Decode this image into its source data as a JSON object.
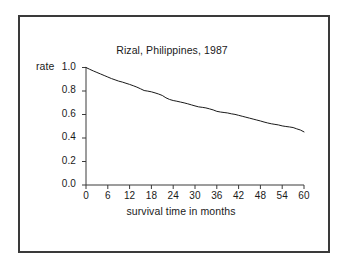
{
  "chart_data": {
    "type": "line",
    "title": "Rizal, Philippines, 1987",
    "xlabel": "survival time in months",
    "ylabel": "rate",
    "xlim": [
      0,
      60
    ],
    "ylim": [
      0.0,
      1.0
    ],
    "grid": false,
    "legend": null,
    "xticks": [
      "0",
      "6",
      "12",
      "18",
      "24",
      "30",
      "36",
      "42",
      "48",
      "54",
      "60"
    ],
    "yticks": [
      "1.0",
      "0.8",
      "0.6",
      "0.4",
      "0.2",
      "0.0"
    ],
    "line_color": "#1a1a1a",
    "series": [
      {
        "name": "survival rate",
        "x": [
          0,
          1,
          2,
          3,
          4,
          5,
          6,
          7,
          8,
          9,
          10,
          11,
          12,
          13,
          14,
          15,
          16,
          17,
          18,
          19,
          20,
          21,
          22,
          23,
          24,
          25,
          26,
          27,
          28,
          29,
          30,
          31,
          32,
          33,
          34,
          35,
          36,
          37,
          38,
          39,
          40,
          41,
          42,
          43,
          44,
          45,
          46,
          47,
          48,
          49,
          50,
          51,
          52,
          53,
          54,
          55,
          56,
          57,
          58,
          59,
          60
        ],
        "values": [
          1.0,
          0.985,
          0.971,
          0.958,
          0.945,
          0.932,
          0.919,
          0.906,
          0.895,
          0.884,
          0.876,
          0.866,
          0.856,
          0.845,
          0.833,
          0.819,
          0.804,
          0.799,
          0.793,
          0.784,
          0.774,
          0.762,
          0.742,
          0.728,
          0.719,
          0.713,
          0.706,
          0.699,
          0.691,
          0.682,
          0.673,
          0.665,
          0.661,
          0.656,
          0.648,
          0.639,
          0.627,
          0.621,
          0.617,
          0.613,
          0.606,
          0.601,
          0.593,
          0.585,
          0.577,
          0.569,
          0.561,
          0.553,
          0.545,
          0.536,
          0.528,
          0.521,
          0.516,
          0.511,
          0.503,
          0.498,
          0.494,
          0.489,
          0.478,
          0.468,
          0.452
        ]
      }
    ]
  },
  "axis": {
    "title": "Rizal, Philippines, 1987",
    "ylabel": "rate",
    "xlabel": "survival time in months",
    "ytick_labels": [
      "1.0",
      "0.8",
      "0.6",
      "0.4",
      "0.2",
      "0.0"
    ],
    "xtick_labels": [
      "0",
      "6",
      "12",
      "18",
      "24",
      "30",
      "36",
      "42",
      "48",
      "54",
      "60"
    ]
  }
}
